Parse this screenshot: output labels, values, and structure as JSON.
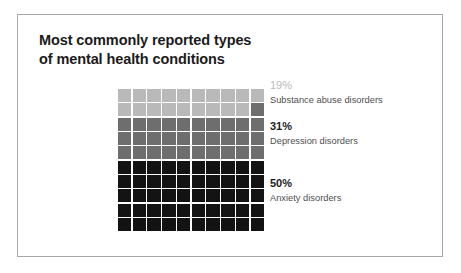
{
  "card": {
    "title_line1": "Most commonly reported types",
    "title_line2": "of mental health conditions"
  },
  "chart_data": {
    "type": "waffle",
    "title": "Most commonly reported types of mental health conditions",
    "xlabel": "",
    "ylabel": "",
    "grid_rows": 10,
    "grid_cols": 10,
    "total_cells": 100,
    "unit": "1 cell = 1%",
    "fill_order": "top-to-bottom, left-to-right within row",
    "categories": [
      "Substance abuse disorders",
      "Depression disorders",
      "Anxiety disorders"
    ],
    "values": [
      19,
      31,
      50
    ],
    "value_labels": [
      "19%",
      "31%",
      "50%"
    ],
    "colors": [
      "#b9b9b9",
      "#6e6e6e",
      "#131313"
    ],
    "legend_position": "right",
    "grid": false,
    "series": [
      {
        "name": "Substance abuse disorders",
        "value": 19,
        "label": "19%",
        "color": "#b9b9b9",
        "cells": 19,
        "pct_text_color": "#b9b9b9",
        "pct_bold": false
      },
      {
        "name": "Depression disorders",
        "value": 31,
        "label": "31%",
        "color": "#6e6e6e",
        "cells": 31,
        "pct_text_color": "#1b1b1b",
        "pct_bold": true
      },
      {
        "name": "Anxiety disorders",
        "value": 50,
        "label": "50%",
        "color": "#131313",
        "cells": 50,
        "pct_text_color": "#1b1b1b",
        "pct_bold": true
      }
    ]
  },
  "colors": {
    "background": "#ffffff",
    "card_border": "#a8a8a8",
    "title_text": "#1b1b1b",
    "label_text": "#4f4f4f",
    "cell_gap": "#ffffff"
  }
}
